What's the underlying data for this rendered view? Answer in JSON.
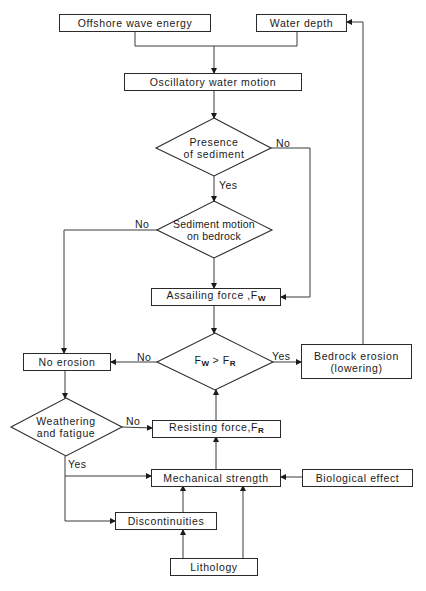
{
  "diagram": {
    "nodes": {
      "offshore_wave_energy": "Offshore wave energy",
      "water_depth": "Water depth",
      "oscillatory_water_motion": "Oscillatory water motion",
      "presence_of_sediment_line1": "Presence",
      "presence_of_sediment_line2": "of sediment",
      "sediment_motion_line1": "Sediment motion",
      "sediment_motion_line2": "on bedrock",
      "assailing_force": "Assailing force ,F",
      "assailing_force_sub": "W",
      "comparison_left": "F",
      "comparison_left_sub": "W",
      "comparison_op": " > ",
      "comparison_right": "F",
      "comparison_right_sub": "R",
      "no_erosion": "No erosion",
      "bedrock_erosion_line1": "Bedrock erosion",
      "bedrock_erosion_line2": "(lowering)",
      "weathering_line1": "Weathering",
      "weathering_line2": "and fatigue",
      "resisting_force": "Resisting force,F",
      "resisting_force_sub": "R",
      "mechanical_strength": "Mechanical strength",
      "biological_effect": "Biological effect",
      "discontinuities": "Discontinuities",
      "lithology": "Lithology"
    },
    "edge_labels": {
      "presence_no": "No",
      "presence_yes": "Yes",
      "sediment_motion_no": "No",
      "comparison_no": "No",
      "comparison_yes": "Yes",
      "weathering_no": "No",
      "weathering_yes": "Yes"
    }
  }
}
